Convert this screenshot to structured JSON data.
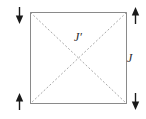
{
  "figure": {
    "name": "lattice-coupling-diagram",
    "background_color": "#ffffff",
    "width": 146,
    "height": 119
  },
  "square": {
    "name": "square-plaquette",
    "stroke_color": "#8a8a8a",
    "stroke_width": 1,
    "fill": "none",
    "x": 30,
    "y": 12,
    "width": 97,
    "height": 92
  },
  "diagonals": {
    "name": "diagonal-bonds",
    "stroke_color": "#a8a8a8",
    "stroke_width": 1,
    "dash_pattern": "2 2",
    "lines": [
      {
        "name": "diagonal-tl-br",
        "x1": 30,
        "y1": 12,
        "x2": 127,
        "y2": 104
      },
      {
        "name": "diagonal-tr-bl",
        "x1": 127,
        "y1": 12,
        "x2": 30,
        "y2": 104
      }
    ],
    "crossing_point": {
      "x": 79,
      "y": 58
    }
  },
  "arrows": {
    "color": "#1a1a1a",
    "items": [
      {
        "name": "arrow-top-left",
        "direction": "down",
        "x": 19,
        "y": 7
      },
      {
        "name": "arrow-top-right",
        "direction": "up",
        "x": 135,
        "y": 7
      },
      {
        "name": "arrow-bottom-left",
        "direction": "up",
        "x": 19,
        "y": 93
      },
      {
        "name": "arrow-bottom-right",
        "direction": "down",
        "x": 135,
        "y": 93
      }
    ]
  },
  "labels": {
    "j_prime": "J′",
    "j": "J"
  }
}
